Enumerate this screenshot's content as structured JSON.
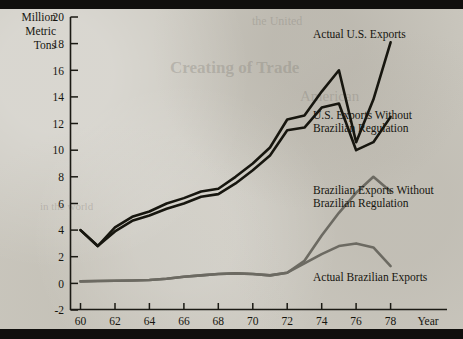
{
  "chart": {
    "y_axis_title_lines": [
      "Million",
      "Metric",
      "Tons"
    ],
    "x_axis_name": "Year",
    "y_ticks": [
      "20",
      "18",
      "16",
      "14",
      "12",
      "10",
      "8",
      "6",
      "4",
      "2",
      "0",
      "-2"
    ],
    "x_ticks": [
      "60",
      "62",
      "64",
      "66",
      "68",
      "70",
      "72",
      "74",
      "76",
      "78"
    ],
    "series_labels": {
      "actual_us": "Actual U.S. Exports",
      "us_without_line1": "U.S. Exports Without",
      "us_without_line2": "Brazilian Regulation",
      "brazil_without_line1": "Brazilian Exports Without",
      "brazil_without_line2": "Brazilian Regulation",
      "actual_brazil": "Actual Brazilian Exports"
    },
    "colors": {
      "us_line": "#17160f",
      "brazil_line": "#6c6a62",
      "axis": "#1b1a14",
      "background": "#cac7be",
      "band": "#100f0d"
    }
  },
  "ghost": {
    "g1": "Creating of Trade",
    "g2": "the United",
    "g3": "American",
    "g4": "in the world"
  },
  "chart_data": {
    "type": "line",
    "title": "",
    "xlabel": "Year",
    "ylabel": "Million Metric Tons",
    "xlim": [
      1959.4,
      1979.5
    ],
    "ylim": [
      -2,
      20
    ],
    "grid": false,
    "legend": "inline-annotations",
    "x": [
      1960,
      1961,
      1962,
      1963,
      1964,
      1965,
      1966,
      1967,
      1968,
      1969,
      1970,
      1971,
      1972,
      1973,
      1974,
      1975,
      1976,
      1977,
      1978
    ],
    "series": [
      {
        "name": "Actual U.S. Exports",
        "color": "#17160f",
        "values": [
          4.0,
          2.8,
          4.2,
          5.0,
          5.4,
          6.0,
          6.4,
          6.9,
          7.1,
          8.0,
          9.0,
          10.2,
          12.3,
          12.6,
          14.4,
          16.0,
          10.6,
          13.8,
          18.1
        ]
      },
      {
        "name": "U.S. Exports Without Brazilian Regulation",
        "color": "#17160f",
        "values": [
          4.0,
          2.8,
          3.9,
          4.7,
          5.1,
          5.6,
          6.0,
          6.5,
          6.7,
          7.5,
          8.5,
          9.6,
          11.5,
          11.7,
          13.2,
          13.5,
          10.0,
          10.6,
          12.5
        ]
      },
      {
        "name": "Brazilian Exports Without Brazilian Regulation",
        "color": "#6c6a62",
        "values": [
          0.15,
          0.18,
          0.2,
          0.22,
          0.25,
          0.35,
          0.5,
          0.6,
          0.7,
          0.75,
          0.7,
          0.6,
          0.8,
          1.7,
          3.6,
          5.3,
          6.8,
          8.0,
          6.9
        ]
      },
      {
        "name": "Actual Brazilian Exports",
        "color": "#6c6a62",
        "values": [
          0.15,
          0.18,
          0.2,
          0.22,
          0.25,
          0.35,
          0.5,
          0.6,
          0.7,
          0.75,
          0.7,
          0.6,
          0.8,
          1.5,
          2.2,
          2.8,
          3.0,
          2.7,
          1.3
        ]
      }
    ]
  }
}
